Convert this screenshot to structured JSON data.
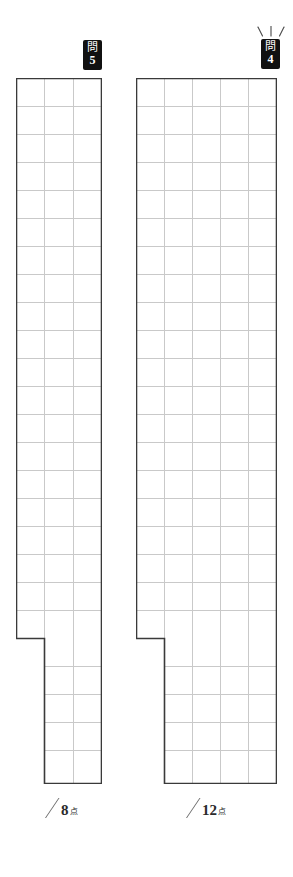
{
  "document": {
    "type": "answer-sheet",
    "language": "ja",
    "background_color": "#ffffff"
  },
  "questions": [
    {
      "id": "q5",
      "badge_kanji": "問",
      "badge_number": "5",
      "badge_color": "#111111",
      "badge_text_color": "#ffffff",
      "has_sparkle": false,
      "grid": {
        "columns": 3,
        "rows": 25,
        "cell_size": 28,
        "notch_column_index": 0,
        "notch_rows": 20,
        "outer_color": "#3a3a3a",
        "inner_color": "#c9c9c9"
      },
      "score": {
        "slash": "/",
        "points": "8",
        "unit": "点"
      }
    },
    {
      "id": "q4",
      "badge_kanji": "問",
      "badge_number": "4",
      "badge_color": "#111111",
      "badge_text_color": "#ffffff",
      "has_sparkle": true,
      "sparkle_color": "#4a4a4a",
      "grid": {
        "columns": 5,
        "rows": 25,
        "cell_size": 28,
        "notch_column_index": 0,
        "notch_rows": 20,
        "outer_color": "#3a3a3a",
        "inner_color": "#c9c9c9"
      },
      "score": {
        "slash": "/",
        "points": "12",
        "unit": "点"
      }
    }
  ]
}
